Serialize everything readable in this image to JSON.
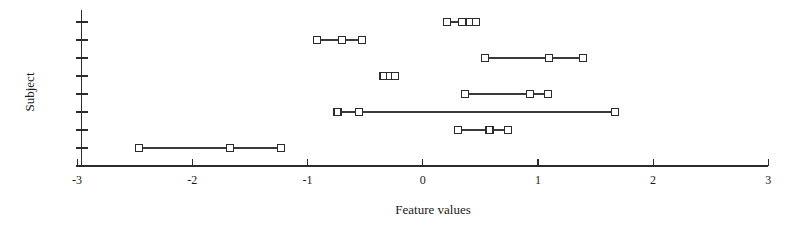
{
  "chart_data": {
    "type": "scatter",
    "title": "",
    "xlabel": "Feature values",
    "ylabel": "Subject",
    "xlim": [
      -3,
      3
    ],
    "xticks": [
      -3,
      -2,
      -1,
      0,
      1,
      2,
      3
    ],
    "xtick_labels": [
      "-3",
      "-2",
      "-1",
      "0",
      "1",
      "2",
      "3"
    ],
    "ylim": [
      0,
      9
    ],
    "yticks": [
      1,
      2,
      3,
      4,
      5,
      6,
      7,
      8,
      9
    ],
    "ytick_labels": [
      "",
      "",
      "",
      "",
      "",
      "",
      "",
      "",
      ""
    ],
    "grid": false,
    "legend": "none",
    "note": "Horizontal range plot: one row per subject, each row connects its feature values with a line and marks each value with an open square.",
    "series": [
      {
        "name": "Subject 1",
        "row": 9,
        "values": [
          0.21,
          0.34,
          0.41,
          0.46
        ],
        "min": 0.21,
        "max": 0.46
      },
      {
        "name": "Subject 2",
        "row": 8,
        "values": [
          -0.92,
          -0.7,
          -0.53
        ],
        "min": -0.92,
        "max": -0.53
      },
      {
        "name": "Subject 3",
        "row": 7,
        "values": [
          0.54,
          1.1,
          1.39
        ],
        "min": 0.54,
        "max": 1.39
      },
      {
        "name": "Subject 4",
        "row": 6,
        "values": [
          -0.34,
          -0.28,
          -0.24
        ],
        "min": -0.34,
        "max": -0.24
      },
      {
        "name": "Subject 5",
        "row": 5,
        "values": [
          0.37,
          0.93,
          1.09
        ],
        "min": 0.37,
        "max": 1.09
      },
      {
        "name": "Subject 6",
        "row": 4,
        "values": [
          -0.74,
          -0.55,
          1.67
        ],
        "min": -0.74,
        "max": 1.67
      },
      {
        "name": "Subject 7",
        "row": 3,
        "values": [
          0.31,
          0.58,
          0.74
        ],
        "min": 0.31,
        "max": 0.74
      },
      {
        "name": "Subject 8",
        "row": 2,
        "values": [
          -2.46,
          -1.67,
          -1.23
        ],
        "min": -2.46,
        "max": -1.23
      }
    ]
  },
  "axes": {
    "x_axis_label": "Feature values",
    "y_axis_label": "Subject"
  }
}
